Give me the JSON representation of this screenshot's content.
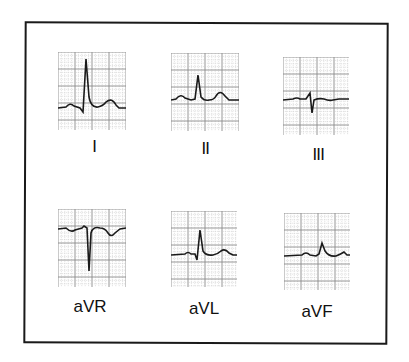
{
  "figure": {
    "title": "",
    "colors": {
      "trace": "#1a1a1a",
      "grid_major": "#8a8a8a",
      "grid_minor": "#c8c8c8",
      "frame": "#1a1a1a",
      "background": "#ffffff"
    }
  },
  "leads": [
    {
      "id": "I",
      "label": "I",
      "morphology": "upright P, tall upright R with small S, upright T"
    },
    {
      "id": "II",
      "label": "II",
      "morphology": "upright P, upright R, upright T"
    },
    {
      "id": "III",
      "label": "III",
      "morphology": "small R, deep S, flat/low T"
    },
    {
      "id": "aVR",
      "label": "aVR",
      "morphology": "inverted P, deep Q/S, inverted T"
    },
    {
      "id": "aVL",
      "label": "aVL",
      "morphology": "small P, upright R with small S, upright T"
    },
    {
      "id": "aVF",
      "label": "aVF",
      "morphology": "small P, small upright R, low T"
    }
  ]
}
